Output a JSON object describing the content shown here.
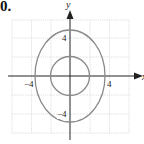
{
  "problem_number": "0.",
  "graph": {
    "x_axis_label": "x",
    "y_axis_label": "y",
    "tick_labels": {
      "y_pos": "4",
      "y_neg": "−4",
      "x_pos": "4",
      "x_neg": "−4"
    },
    "grid_spacing_units": 2,
    "range": [
      -6,
      6
    ],
    "curves": [
      {
        "type": "ellipse",
        "center": [
          0,
          0
        ],
        "semi_x": 3.5,
        "semi_y": 4.7
      },
      {
        "type": "circle",
        "center": [
          0,
          0
        ],
        "radius": 2
      }
    ],
    "colors": {
      "curve": "#8a8a8a",
      "grid": "#d6d6d6",
      "axis": "#222222"
    }
  }
}
